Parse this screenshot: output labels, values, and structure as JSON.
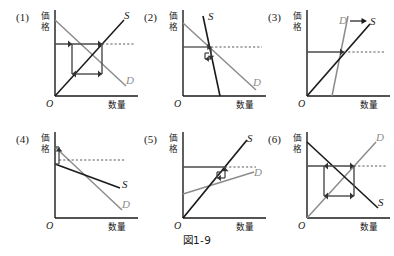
{
  "figure": {
    "caption": "図1-9",
    "axis": {
      "y_label": "価格",
      "y_label_char1": "価",
      "y_label_char2": "格",
      "x_label": "数量",
      "origin_label": "O"
    },
    "colors": {
      "black": "#1a1a1a",
      "gray": "#8c8c8c",
      "cobweb": "#4a4a4a",
      "dashed": "#5a5a5a",
      "background": "#ffffff"
    },
    "panels": [
      {
        "number": "(1)",
        "supply_label": "S",
        "demand_label": "D",
        "supply_color": "#1a1a1a",
        "demand_color": "#8c8c8c",
        "supply_slope": "upward",
        "demand_slope": "downward",
        "pattern": "square-cobweb-divergent",
        "note": "Supply rises at 45 degrees from origin, demand falls from y-axis top; cobweb forms a closed square (perpetual oscillation)"
      },
      {
        "number": "(2)",
        "supply_label": "S",
        "demand_label": "D",
        "supply_color": "#1a1a1a",
        "demand_color": "#8c8c8c",
        "supply_slope": "steep-upward",
        "demand_slope": "shallow-downward",
        "pattern": "convergent-cobweb",
        "note": "Steep supply, flat demand; cobweb spirals inward to equilibrium"
      },
      {
        "number": "(3)",
        "supply_label": "S",
        "demand_label": "D",
        "supply_color": "#1a1a1a",
        "demand_color": "#8c8c8c",
        "supply_slope": "upward",
        "demand_slope": "steep-upward",
        "pattern": "both-upward-arrow",
        "note": "Both curves upward sloping; D label has a horizontal arrow pointing to S"
      },
      {
        "number": "(4)",
        "supply_label": "S",
        "demand_label": "D",
        "supply_color": "#1a1a1a",
        "demand_color": "#8c8c8c",
        "supply_slope": "shallow-downward",
        "demand_slope": "downward",
        "pattern": "narrow-vertical-cobweb",
        "note": "Both curves downward sloping; narrow vertical cobweb hugging the y-axis"
      },
      {
        "number": "(5)",
        "supply_label": "S",
        "demand_label": "D",
        "supply_color": "#1a1a1a",
        "demand_color": "#8c8c8c",
        "supply_slope": "steep-upward",
        "demand_slope": "shallow-upward",
        "pattern": "small-convergent-cobweb",
        "note": "Both curves upward sloping; small cobweb converging at the intersection"
      },
      {
        "number": "(6)",
        "supply_label": "S",
        "demand_label": "D",
        "supply_color": "#1a1a1a",
        "demand_color": "#8c8c8c",
        "supply_slope": "downward",
        "demand_slope": "upward",
        "pattern": "square-cobweb-divergent",
        "note": "Supply falls from y-axis top (black), demand rises from origin (gray); closed-square cobweb"
      }
    ]
  }
}
